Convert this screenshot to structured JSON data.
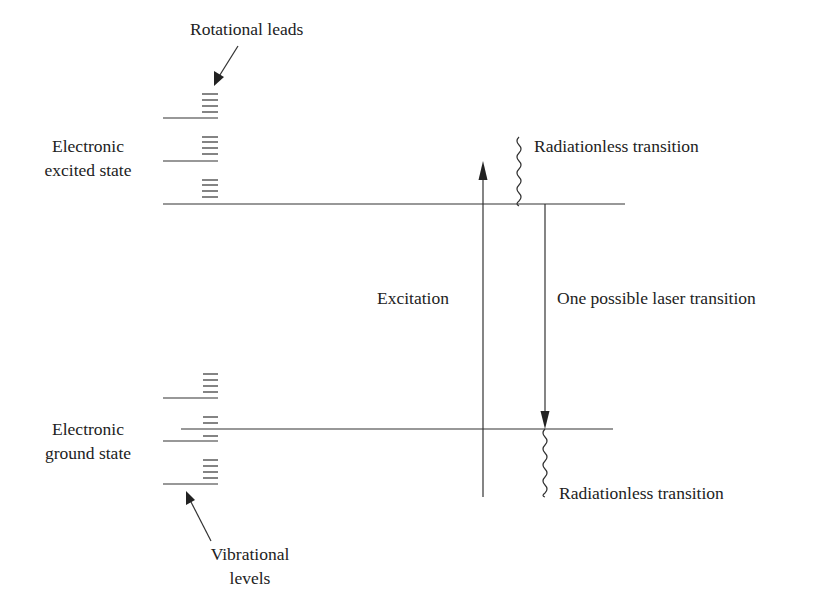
{
  "diagram": {
    "type": "energy-level-diagram",
    "labels": {
      "rotational_leads": "Rotational leads",
      "excited_state_line1": "Electronic",
      "excited_state_line2": "excited state",
      "ground_state_line1": "Electronic",
      "ground_state_line2": "ground state",
      "vibrational_line1": "Vibrational",
      "vibrational_line2": "levels",
      "excitation": "Excitation",
      "laser_transition": "One possible laser transition",
      "radiationless_top": "Radiationless transition",
      "radiationless_bottom": "Radiationless transition"
    },
    "colors": {
      "line": "#333333",
      "text": "#222222",
      "background": "#ffffff"
    },
    "excited_state": {
      "main_level_y": 204,
      "vibrational_levels_y": [
        118,
        161
      ],
      "rotational_groups_y": [
        [
          94,
          100,
          106,
          112
        ],
        [
          137,
          142,
          148,
          154
        ],
        [
          180,
          185,
          191,
          197
        ]
      ]
    },
    "ground_state": {
      "main_level_y": 429,
      "vibrational_levels_y": [
        398,
        441,
        484
      ],
      "rotational_groups_y": [
        [
          374,
          380,
          386,
          392
        ],
        [
          417,
          423,
          436
        ],
        [
          460,
          466,
          472,
          478
        ]
      ]
    },
    "arrows": [
      {
        "name": "excitation",
        "from_y": 496,
        "to_y": 163,
        "x": 483,
        "direction": "up"
      },
      {
        "name": "laser-transition",
        "from_y": 204,
        "to_y": 429,
        "x": 545,
        "direction": "down"
      },
      {
        "name": "radiationless-top",
        "kind": "wavy",
        "x": 519,
        "from_y": 137,
        "to_y": 204
      },
      {
        "name": "radiationless-bottom",
        "kind": "wavy",
        "x": 545,
        "from_y": 429,
        "to_y": 497
      }
    ]
  }
}
